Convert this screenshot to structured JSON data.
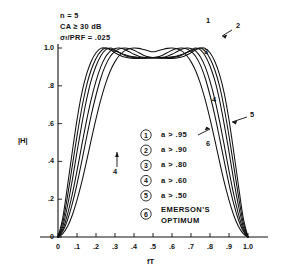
{
  "chart_data": {
    "type": "line",
    "title": "",
    "xlabel": "fT",
    "ylabel": "|H|",
    "xlim": [
      0,
      1.0
    ],
    "ylim": [
      0,
      1.0
    ],
    "grid": false,
    "legend_position": "inside-bottom-center",
    "xticks": [
      "0",
      ".1",
      ".2",
      ".3",
      ".4",
      ".5",
      ".6",
      ".7",
      ".8",
      ".9",
      "1.0"
    ],
    "xtick_values": [
      0,
      0.1,
      0.2,
      0.3,
      0.4,
      0.5,
      0.6,
      0.7,
      0.8,
      0.9,
      1.0
    ],
    "yticks": [
      "0",
      ".2",
      ".4",
      ".6",
      ".8",
      "1.0"
    ],
    "ytick_values": [
      0,
      0.2,
      0.4,
      0.6,
      0.8,
      1.0
    ],
    "x": [
      0.0,
      0.025,
      0.05,
      0.075,
      0.1,
      0.125,
      0.15,
      0.175,
      0.2,
      0.225,
      0.25,
      0.275,
      0.3,
      0.325,
      0.35,
      0.375,
      0.4,
      0.425,
      0.45,
      0.475,
      0.5,
      0.525,
      0.55,
      0.575,
      0.6,
      0.625,
      0.65,
      0.675,
      0.7,
      0.725,
      0.75,
      0.775,
      0.8,
      0.825,
      0.85,
      0.875,
      0.9,
      0.925,
      0.95,
      0.975,
      1.0
    ],
    "series": [
      {
        "name": "1",
        "label": "a > .95",
        "values": [
          0.0,
          0.1,
          0.27,
          0.45,
          0.62,
          0.76,
          0.86,
          0.93,
          0.975,
          0.998,
          1.0,
          0.995,
          0.985,
          0.975,
          0.965,
          0.958,
          0.953,
          0.95,
          0.949,
          0.949,
          0.949,
          0.949,
          0.949,
          0.95,
          0.953,
          0.958,
          0.965,
          0.975,
          0.985,
          0.995,
          1.0,
          0.998,
          0.975,
          0.93,
          0.86,
          0.76,
          0.62,
          0.45,
          0.27,
          0.1,
          0.0
        ]
      },
      {
        "name": "2",
        "label": "a > .90",
        "values": [
          0.0,
          0.075,
          0.215,
          0.375,
          0.535,
          0.68,
          0.8,
          0.885,
          0.945,
          0.982,
          1.0,
          0.99,
          0.975,
          0.962,
          0.952,
          0.947,
          0.945,
          0.945,
          0.946,
          0.947,
          0.948,
          0.947,
          0.946,
          0.945,
          0.945,
          0.947,
          0.952,
          0.962,
          0.975,
          0.99,
          1.0,
          0.982,
          0.945,
          0.885,
          0.8,
          0.68,
          0.535,
          0.375,
          0.215,
          0.075,
          0.0
        ]
      },
      {
        "name": "3",
        "label": "a > .80",
        "values": [
          0.0,
          0.055,
          0.165,
          0.3,
          0.45,
          0.595,
          0.725,
          0.83,
          0.905,
          0.958,
          0.99,
          1.0,
          0.99,
          0.975,
          0.962,
          0.953,
          0.949,
          0.947,
          0.947,
          0.948,
          0.948,
          0.948,
          0.947,
          0.947,
          0.949,
          0.953,
          0.962,
          0.975,
          0.99,
          1.0,
          0.99,
          0.958,
          0.905,
          0.83,
          0.725,
          0.595,
          0.45,
          0.3,
          0.165,
          0.055,
          0.0
        ]
      },
      {
        "name": "4",
        "label": "a > .60",
        "values": [
          0.0,
          0.04,
          0.12,
          0.225,
          0.35,
          0.485,
          0.615,
          0.73,
          0.825,
          0.9,
          0.952,
          0.983,
          0.998,
          1.0,
          0.993,
          0.98,
          0.967,
          0.957,
          0.951,
          0.949,
          0.948,
          0.949,
          0.951,
          0.957,
          0.967,
          0.98,
          0.993,
          1.0,
          0.998,
          0.983,
          0.952,
          0.9,
          0.825,
          0.73,
          0.615,
          0.485,
          0.35,
          0.225,
          0.12,
          0.04,
          0.0
        ]
      },
      {
        "name": "5",
        "label": "a > .50",
        "values": [
          0.0,
          0.03,
          0.09,
          0.175,
          0.28,
          0.4,
          0.525,
          0.645,
          0.75,
          0.84,
          0.908,
          0.955,
          0.982,
          0.996,
          1.0,
          0.997,
          0.988,
          0.975,
          0.962,
          0.953,
          0.949,
          0.953,
          0.962,
          0.975,
          0.988,
          0.997,
          1.0,
          0.996,
          0.982,
          0.955,
          0.908,
          0.84,
          0.75,
          0.645,
          0.525,
          0.4,
          0.28,
          0.175,
          0.09,
          0.03,
          0.0
        ]
      },
      {
        "name": "6",
        "label": "EMERSON'S OPTIMUM",
        "values": [
          0.0,
          0.018,
          0.055,
          0.115,
          0.195,
          0.29,
          0.4,
          0.515,
          0.625,
          0.725,
          0.81,
          0.878,
          0.928,
          0.963,
          0.985,
          0.996,
          1.0,
          0.998,
          0.992,
          0.985,
          0.98,
          0.985,
          0.992,
          0.998,
          1.0,
          0.996,
          0.985,
          0.963,
          0.928,
          0.878,
          0.81,
          0.725,
          0.625,
          0.515,
          0.4,
          0.29,
          0.195,
          0.115,
          0.055,
          0.018,
          0.0
        ]
      }
    ],
    "annotations": [
      {
        "name": "n",
        "text": "n = 5"
      },
      {
        "name": "clutter-attenuation",
        "text": "CA ≥ 30 dB"
      },
      {
        "name": "sigma-prf",
        "text_prefix": "σ",
        "text_sub": "f",
        "text_suffix": "/PRF = .025"
      }
    ],
    "curve_callouts": [
      "1",
      "2",
      "3",
      "4",
      "5",
      "6"
    ]
  },
  "params": {
    "line1": "n = 5",
    "line2": "CA ≥ 30 dB",
    "line3_prefix": "σ",
    "line3_sub": "f",
    "line3_suffix": "/PRF = .025"
  },
  "axes": {
    "y_label": "|H|",
    "x_label": "fT",
    "x_ticks": [
      "0",
      ".1",
      ".2",
      ".3",
      ".4",
      ".5",
      ".6",
      ".7",
      ".8",
      ".9",
      "1.0"
    ],
    "y_ticks": [
      "1.0",
      ".8",
      ".6",
      ".4",
      ".2",
      "0"
    ]
  },
  "callouts": {
    "c1": "1",
    "c2": "2",
    "c3": "3",
    "c4": "4",
    "c5": "5",
    "c6": "6",
    "c4_left": "4",
    "c6_left": "6"
  },
  "legend": {
    "rows": [
      {
        "num": "1",
        "text": "a > .95"
      },
      {
        "num": "2",
        "text": "a > .90"
      },
      {
        "num": "3",
        "text": "a > .80"
      },
      {
        "num": "4",
        "text": "a > .60"
      },
      {
        "num": "5",
        "text": "a > .50"
      }
    ],
    "emerson": {
      "num": "6",
      "line1": "EMERSON'S",
      "line2": "OPTIMUM"
    }
  },
  "colors": {
    "ink": "#111111",
    "background": "#ffffff"
  }
}
